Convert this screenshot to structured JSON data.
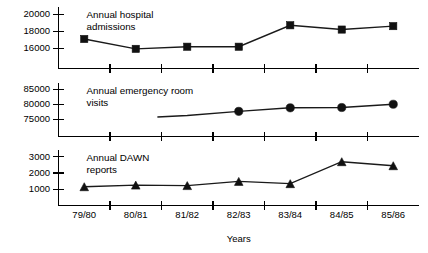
{
  "chart_data": {
    "type": "line",
    "title": "",
    "xlabel": "Years",
    "ylabel": "",
    "grid": false,
    "legend": "inline-labels",
    "categories": [
      "79/80",
      "80/81",
      "81/82",
      "82/83",
      "83/84",
      "84/85",
      "85/86"
    ],
    "panels": [
      {
        "name": "Annual hospital admissions",
        "label_line1": "Annual hospital",
        "label_line2": "admissions",
        "marker": "square",
        "ylim": [
          15000,
          20600
        ],
        "yticks": [
          16000,
          18000,
          20000
        ],
        "ytick_labels": [
          "16000",
          "18000",
          "20000"
        ],
        "x": [
          "79/80",
          "80/81",
          "81/82",
          "82/83",
          "83/84",
          "84/85",
          "85/86"
        ],
        "values": [
          17100,
          15950,
          16200,
          16200,
          18700,
          18200,
          18600
        ]
      },
      {
        "name": "Annual emergency room visits",
        "label_line1": "Annual emergency room",
        "label_line2": "visits",
        "marker": "circle",
        "ylim": [
          73000,
          86500
        ],
        "yticks": [
          75000,
          80000,
          85000
        ],
        "ytick_labels": [
          "75000",
          "80000",
          "85000"
        ],
        "x": [
          "80/81",
          "81/82",
          "82/83",
          "83/84",
          "84/85",
          "85/86"
        ],
        "values": [
          75300,
          76200,
          77600,
          78800,
          78900,
          80000
        ],
        "markers_from": "82/83",
        "note": "line begins between 80/81 and 81/82; markers drawn only for 82/83 onward"
      },
      {
        "name": "Annual DAWN reports",
        "label_line1": "Annual DAWN",
        "label_line2": "reports",
        "marker": "triangle",
        "ylim": [
          700,
          3300
        ],
        "yticks": [
          1000,
          2000,
          3000
        ],
        "ytick_labels": [
          "1000",
          "2000",
          "3000"
        ],
        "x": [
          "79/80",
          "80/81",
          "81/82",
          "82/83",
          "83/84",
          "84/85",
          "85/86"
        ],
        "values": [
          1150,
          1250,
          1220,
          1480,
          1340,
          2700,
          2450
        ]
      }
    ]
  },
  "colors": {
    "axis": "#000000",
    "line": "#1a1a1a",
    "marker": "#111111",
    "background": "#ffffff"
  },
  "axis": {
    "x_title": "Years",
    "x_labels": [
      "79/80",
      "80/81",
      "81/82",
      "82/83",
      "83/84",
      "84/85",
      "85/86"
    ]
  },
  "panel1": {
    "label_line1": "Annual hospital",
    "label_line2": "admissions",
    "yt0": "20000",
    "yt1": "18000",
    "yt2": "16000"
  },
  "panel2": {
    "label_line1": "Annual emergency room",
    "label_line2": "visits",
    "yt0": "85000",
    "yt1": "80000",
    "yt2": "75000"
  },
  "panel3": {
    "label_line1": "Annual DAWN",
    "label_line2": "reports",
    "yt0": "3000",
    "yt1": "2000",
    "yt2": "1000"
  }
}
